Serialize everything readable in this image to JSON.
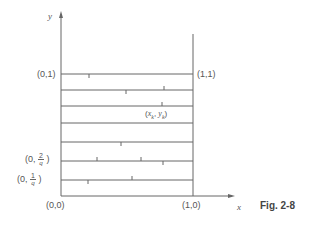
{
  "figure": {
    "caption": "Fig. 2-8",
    "axes": {
      "x_label": "x",
      "y_label": "y"
    },
    "corner_labels": {
      "origin": "(0,0)",
      "x_one": "(1,0)",
      "top_left": "(0,1)",
      "top_right": "(1,1)"
    },
    "left_labels": [
      {
        "prefix": "(0,",
        "num": "2",
        "den": "q",
        "suffix": ")"
      },
      {
        "prefix": "(0,",
        "num": "1",
        "den": "q",
        "suffix": ")"
      }
    ],
    "point_label": {
      "open": "(",
      "x": "x",
      "x_sub": "k",
      "sep": ", ",
      "y": "y",
      "y_sub": "k",
      "close": ")"
    },
    "colors": {
      "line": "#666666",
      "text": "#555555",
      "background": "#ffffff"
    }
  }
}
